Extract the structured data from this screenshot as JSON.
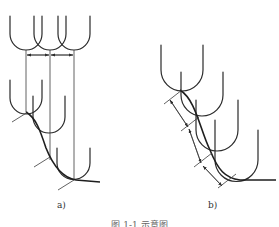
{
  "figure": {
    "panels": [
      {
        "id": "a",
        "label": "a)"
      },
      {
        "id": "b",
        "label": "b)"
      }
    ],
    "caption": "图 1-1  示意图",
    "line_color": "#2a2a2a",
    "background": "#ffffff"
  }
}
